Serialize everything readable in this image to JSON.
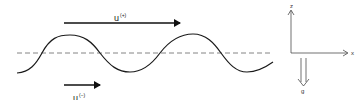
{
  "diagram": {
    "type": "wave-flow-schematic",
    "waveform": {
      "shape": "sinusoid",
      "mean_level": "dashed-horizontal-line",
      "color": "#222222",
      "dash_color": "#555555"
    },
    "upper_flow": {
      "label_main": "u",
      "label_sup": "(+)",
      "arrow_direction": "right",
      "relative_length": "long"
    },
    "lower_flow": {
      "label_main": "u",
      "label_sup": "(−)",
      "arrow_direction": "right",
      "relative_length": "short"
    },
    "axes": {
      "vertical_label": "z",
      "horizontal_label": "x",
      "gravity_label": "g",
      "gravity_direction": "down"
    }
  }
}
